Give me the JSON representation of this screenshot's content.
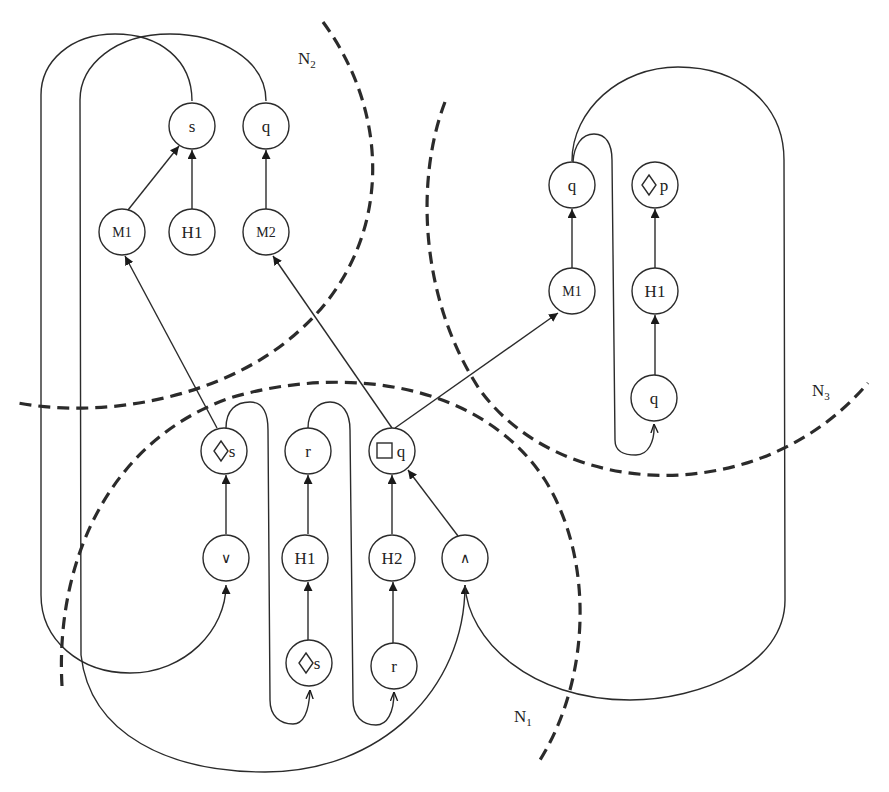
{
  "diagram": {
    "regions": [
      {
        "id": "N1",
        "label": "N",
        "sub": "1"
      },
      {
        "id": "N2",
        "label": "N",
        "sub": "2"
      },
      {
        "id": "N3",
        "label": "N",
        "sub": "3"
      }
    ],
    "nodes": {
      "n2_s": "s",
      "n2_q": "q",
      "n2_m1": "M1",
      "n2_h1": "H1",
      "n2_m2": "M2",
      "n1_diamond_s_top": "s",
      "n1_r_top": "r",
      "n1_box_q": "q",
      "n1_or": "∨",
      "n1_h1": "H1",
      "n1_h2": "H2",
      "n1_and": "∧",
      "n1_diamond_s_bottom": "s",
      "n1_r_bottom": "r",
      "n3_q_top": "q",
      "n3_diamond_p": "p",
      "n3_m1": "M1",
      "n3_h1": "H1",
      "n3_q_bottom": "q"
    },
    "edges": [
      {
        "from": "M1 (N2)",
        "to": "s (N2)"
      },
      {
        "from": "H1 (N2)",
        "to": "s (N2)"
      },
      {
        "from": "M2 (N2)",
        "to": "q (N2)"
      },
      {
        "from": "◇s (N1)",
        "to": "M1 (N2)"
      },
      {
        "from": "□q (N1)",
        "to": "M2 (N2)"
      },
      {
        "from": "□q (N1)",
        "to": "M1 (N3)"
      },
      {
        "from": "∨ (N1)",
        "to": "◇s (N1)"
      },
      {
        "from": "H1 (N1)",
        "to": "r (N1)"
      },
      {
        "from": "◇s bottom (N1)",
        "to": "H1 (N1)"
      },
      {
        "from": "H2 (N1)",
        "to": "□q (N1)"
      },
      {
        "from": "r bottom (N1)",
        "to": "H2 (N1)"
      },
      {
        "from": "∧ (N1)",
        "to": "□q (N1)"
      },
      {
        "from": "M1 (N3)",
        "to": "q (N3)"
      },
      {
        "from": "H1 (N3)",
        "to": "◇p (N3)"
      },
      {
        "from": "q bottom (N3)",
        "to": "H1 (N3)"
      }
    ],
    "colors": {
      "stroke": "#2b2b2b",
      "background": "#ffffff"
    }
  }
}
